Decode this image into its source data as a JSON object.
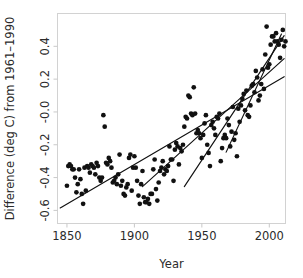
{
  "chart_data": {
    "type": "scatter",
    "title": "",
    "xlabel": "Year",
    "ylabel": "Difference (deg C) from 1961–1990",
    "xlim": [
      1843,
      2012
    ],
    "ylim": [
      -0.68,
      0.6
    ],
    "xticks": [
      1850,
      1900,
      1950,
      2000
    ],
    "xticklabels": [
      "1850",
      "1900",
      "1950",
      "2000"
    ],
    "yticks": [
      -0.6,
      -0.4,
      -0.2,
      -0.0,
      0.2,
      0.4
    ],
    "yticklabels": [
      "-0.6",
      "-0.4",
      "-0.2",
      "-0.0",
      "0.2",
      "0.4"
    ],
    "grid": false,
    "legend": null,
    "marker": "filled-circle",
    "marker_color": "#111111",
    "points": [
      [
        1850,
        -0.45
      ],
      [
        1851,
        -0.33
      ],
      [
        1852,
        -0.32
      ],
      [
        1853,
        -0.33
      ],
      [
        1854,
        -0.35
      ],
      [
        1855,
        -0.35
      ],
      [
        1856,
        -0.4
      ],
      [
        1857,
        -0.49
      ],
      [
        1858,
        -0.44
      ],
      [
        1859,
        -0.35
      ],
      [
        1860,
        -0.41
      ],
      [
        1861,
        -0.5
      ],
      [
        1862,
        -0.56
      ],
      [
        1863,
        -0.34
      ],
      [
        1864,
        -0.48
      ],
      [
        1865,
        -0.33
      ],
      [
        1866,
        -0.34
      ],
      [
        1867,
        -0.37
      ],
      [
        1868,
        -0.32
      ],
      [
        1869,
        -0.33
      ],
      [
        1870,
        -0.34
      ],
      [
        1871,
        -0.38
      ],
      [
        1872,
        -0.31
      ],
      [
        1873,
        -0.33
      ],
      [
        1874,
        -0.4
      ],
      [
        1875,
        -0.42
      ],
      [
        1876,
        -0.4
      ],
      [
        1877,
        -0.02
      ],
      [
        1878,
        -0.09
      ],
      [
        1879,
        -0.31
      ],
      [
        1880,
        -0.32
      ],
      [
        1881,
        -0.28
      ],
      [
        1882,
        -0.3
      ],
      [
        1883,
        -0.34
      ],
      [
        1884,
        -0.43
      ],
      [
        1885,
        -0.42
      ],
      [
        1886,
        -0.4
      ],
      [
        1887,
        -0.44
      ],
      [
        1888,
        -0.38
      ],
      [
        1889,
        -0.26
      ],
      [
        1890,
        -0.45
      ],
      [
        1891,
        -0.42
      ],
      [
        1892,
        -0.5
      ],
      [
        1893,
        -0.51
      ],
      [
        1894,
        -0.46
      ],
      [
        1895,
        -0.44
      ],
      [
        1896,
        -0.28
      ],
      [
        1897,
        -0.26
      ],
      [
        1898,
        -0.48
      ],
      [
        1899,
        -0.34
      ],
      [
        1900,
        -0.27
      ],
      [
        1901,
        -0.34
      ],
      [
        1902,
        -0.42
      ],
      [
        1903,
        -0.51
      ],
      [
        1904,
        -0.56
      ],
      [
        1905,
        -0.44
      ],
      [
        1906,
        -0.36
      ],
      [
        1907,
        -0.52
      ],
      [
        1908,
        -0.55
      ],
      [
        1909,
        -0.55
      ],
      [
        1910,
        -0.53
      ],
      [
        1911,
        -0.56
      ],
      [
        1912,
        -0.5
      ],
      [
        1913,
        -0.5
      ],
      [
        1914,
        -0.35
      ],
      [
        1915,
        -0.29
      ],
      [
        1916,
        -0.47
      ],
      [
        1917,
        -0.54
      ],
      [
        1918,
        -0.43
      ],
      [
        1919,
        -0.36
      ],
      [
        1920,
        -0.34
      ],
      [
        1921,
        -0.3
      ],
      [
        1922,
        -0.38
      ],
      [
        1923,
        -0.35
      ],
      [
        1924,
        -0.36
      ],
      [
        1925,
        -0.33
      ],
      [
        1926,
        -0.21
      ],
      [
        1927,
        -0.29
      ],
      [
        1928,
        -0.29
      ],
      [
        1929,
        -0.42
      ],
      [
        1930,
        -0.23
      ],
      [
        1931,
        -0.19
      ],
      [
        1932,
        -0.21
      ],
      [
        1933,
        -0.32
      ],
      [
        1934,
        -0.22
      ],
      [
        1935,
        -0.24
      ],
      [
        1936,
        -0.2
      ],
      [
        1937,
        -0.09
      ],
      [
        1938,
        -0.03
      ],
      [
        1939,
        -0.04
      ],
      [
        1940,
        0.1
      ],
      [
        1941,
        0.09
      ],
      [
        1942,
        -0.01
      ],
      [
        1943,
        -0.02
      ],
      [
        1944,
        0.15
      ],
      [
        1945,
        -0.01
      ],
      [
        1946,
        -0.13
      ],
      [
        1947,
        -0.11
      ],
      [
        1948,
        -0.13
      ],
      [
        1949,
        -0.16
      ],
      [
        1950,
        -0.28
      ],
      [
        1951,
        -0.14
      ],
      [
        1952,
        -0.07
      ],
      [
        1953,
        -0.02
      ],
      [
        1954,
        -0.2
      ],
      [
        1955,
        -0.25
      ],
      [
        1956,
        -0.33
      ],
      [
        1957,
        -0.08
      ],
      [
        1958,
        -0.06
      ],
      [
        1959,
        -0.1
      ],
      [
        1960,
        -0.14
      ],
      [
        1961,
        -0.03
      ],
      [
        1962,
        -0.04
      ],
      [
        1963,
        -0.01
      ],
      [
        1964,
        -0.3
      ],
      [
        1965,
        -0.22
      ],
      [
        1966,
        -0.16
      ],
      [
        1967,
        -0.14
      ],
      [
        1968,
        -0.16
      ],
      [
        1969,
        -0.04
      ],
      [
        1970,
        -0.08
      ],
      [
        1971,
        -0.21
      ],
      [
        1972,
        -0.12
      ],
      [
        1973,
        0.03
      ],
      [
        1974,
        -0.17
      ],
      [
        1975,
        -0.13
      ],
      [
        1976,
        -0.27
      ],
      [
        1977,
        0.02
      ],
      [
        1978,
        -0.06
      ],
      [
        1979,
        0.04
      ],
      [
        1980,
        0.08
      ],
      [
        1981,
        0.11
      ],
      [
        1982,
        0.01
      ],
      [
        1983,
        0.13
      ],
      [
        1984,
        -0.02
      ],
      [
        1985,
        -0.03
      ],
      [
        1986,
        0.04
      ],
      [
        1987,
        0.16
      ],
      [
        1988,
        0.17
      ],
      [
        1989,
        0.12
      ],
      [
        1990,
        0.25
      ],
      [
        1991,
        0.21
      ],
      [
        1992,
        0.07
      ],
      [
        1993,
        0.1
      ],
      [
        1994,
        0.17
      ],
      [
        1995,
        0.26
      ],
      [
        1996,
        0.14
      ],
      [
        1997,
        0.35
      ],
      [
        1998,
        0.52
      ],
      [
        1999,
        0.27
      ],
      [
        2000,
        0.29
      ],
      [
        2001,
        0.41
      ],
      [
        2002,
        0.46
      ],
      [
        2003,
        0.46
      ],
      [
        2004,
        0.43
      ],
      [
        2005,
        0.48
      ],
      [
        2006,
        0.43
      ],
      [
        2007,
        0.41
      ],
      [
        2008,
        0.33
      ],
      [
        2009,
        0.44
      ],
      [
        2010,
        0.5
      ],
      [
        2011,
        0.4
      ],
      [
        2012,
        0.43
      ]
    ],
    "trend_lines": [
      {
        "name": "trend-1850-2010",
        "x": [
          1845,
          2011
        ],
        "y": [
          -0.585,
          0.215
        ]
      },
      {
        "name": "trend-1910-2010",
        "x": [
          1906,
          2011
        ],
        "y": [
          -0.455,
          0.325
        ]
      },
      {
        "name": "trend-1940-2010",
        "x": [
          1937,
          2011
        ],
        "y": [
          -0.455,
          0.465
        ]
      },
      {
        "name": "trend-1970-2010",
        "x": [
          1968,
          2009
        ],
        "y": [
          -0.245,
          0.475
        ]
      }
    ]
  }
}
